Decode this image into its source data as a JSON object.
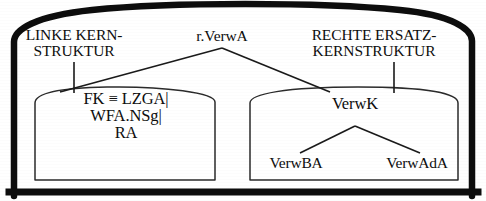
{
  "figure": {
    "kind": "syntax-tree-diagram",
    "language": "de",
    "ink_color": "#0d0d0d",
    "background_color": "#ffffff"
  },
  "captions": {
    "left": {
      "line1": "LINKE KERN-",
      "line2": "STRUKTUR"
    },
    "apex": {
      "line1": "r.VerwA"
    },
    "right": {
      "line1": "RECHTE ERSATZ-",
      "line2": "KERNSTRUKTUR"
    }
  },
  "left_box": {
    "lines": [
      "FK ≡ LZGA|",
      "WFA.NSg|",
      "RA"
    ]
  },
  "right_box": {
    "root": "VerwK",
    "children": [
      "VerwBA",
      "VerwAdA"
    ]
  }
}
